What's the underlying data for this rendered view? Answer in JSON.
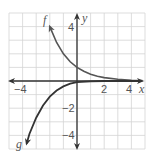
{
  "chart_data": {
    "type": "line",
    "title": "",
    "xlabel": "x",
    "ylabel": "y",
    "xlim": [
      -5,
      5
    ],
    "ylim": [
      -5,
      5
    ],
    "grid": true,
    "x_tick_labels": [
      {
        "value": -4,
        "label": "−4"
      },
      {
        "value": 2,
        "label": "2"
      },
      {
        "value": 4,
        "label": "4"
      }
    ],
    "y_tick_labels": [
      {
        "value": 4,
        "label": "4"
      },
      {
        "value": -2,
        "label": "−2"
      },
      {
        "value": -4,
        "label": "−4"
      }
    ],
    "series": [
      {
        "name": "f",
        "label": "f",
        "color": "#555555",
        "points": [
          [
            -2,
            4
          ],
          [
            -1.5,
            2.83
          ],
          [
            -1,
            2
          ],
          [
            -0.5,
            1.41
          ],
          [
            0,
            1
          ],
          [
            0.5,
            0.71
          ],
          [
            1,
            0.5
          ],
          [
            1.5,
            0.35
          ],
          [
            2,
            0.25
          ],
          [
            3,
            0.125
          ],
          [
            4,
            0.06
          ],
          [
            4.8,
            0.04
          ]
        ]
      },
      {
        "name": "g",
        "label": "g",
        "color": "#333333",
        "points": [
          [
            -3.7,
            -4.6
          ],
          [
            -3.5,
            -3.9
          ],
          [
            -3,
            -2.7
          ],
          [
            -2.5,
            -1.8
          ],
          [
            -2,
            -1.15
          ],
          [
            -1.5,
            -0.7
          ],
          [
            -1,
            -0.4
          ],
          [
            -0.5,
            -0.2
          ],
          [
            0,
            -0.08
          ],
          [
            1,
            -0.02
          ],
          [
            2,
            0
          ],
          [
            4.8,
            0
          ]
        ]
      }
    ]
  },
  "labels": {
    "x_axis": "x",
    "y_axis": "y",
    "f": "f",
    "g": "g",
    "x_neg4": "−4",
    "x_2": "2",
    "x_4": "4",
    "y_4": "4",
    "y_neg2": "−2",
    "y_neg4": "−4"
  },
  "colors": {
    "grid": "#d4d4d4",
    "axis": "#333333",
    "f_curve": "#555555",
    "g_curve": "#333333"
  }
}
